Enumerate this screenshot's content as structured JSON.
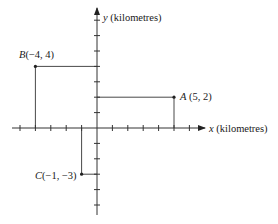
{
  "diagram": {
    "type": "cartesian-plane",
    "axes": {
      "x_label_var": "x",
      "x_label_unit": " (kilometres)",
      "y_label_var": "y",
      "y_label_unit": " (kilometres)",
      "x_ticks": [
        -5,
        -4,
        -3,
        -2,
        -1,
        1,
        2,
        3,
        4,
        5,
        6
      ],
      "y_ticks": [
        -5,
        -4,
        -3,
        -2,
        -1,
        1,
        2,
        3,
        4,
        5,
        6,
        7
      ],
      "x_range": [
        -5.5,
        6.5
      ],
      "y_range": [
        -5.5,
        8
      ]
    },
    "points": [
      {
        "name": "A",
        "coords": " (5, 2)",
        "x": 5,
        "y": 2,
        "label_side": "right"
      },
      {
        "name": "B",
        "coords": "(−4, 4)",
        "x": -4,
        "y": 4,
        "label_side": "above"
      },
      {
        "name": "C",
        "coords": "(−1, −3)",
        "x": -1,
        "y": -3,
        "label_side": "left"
      }
    ],
    "colors": {
      "line": "#333333",
      "point": "#222222",
      "text": "#1a1a1a"
    }
  }
}
